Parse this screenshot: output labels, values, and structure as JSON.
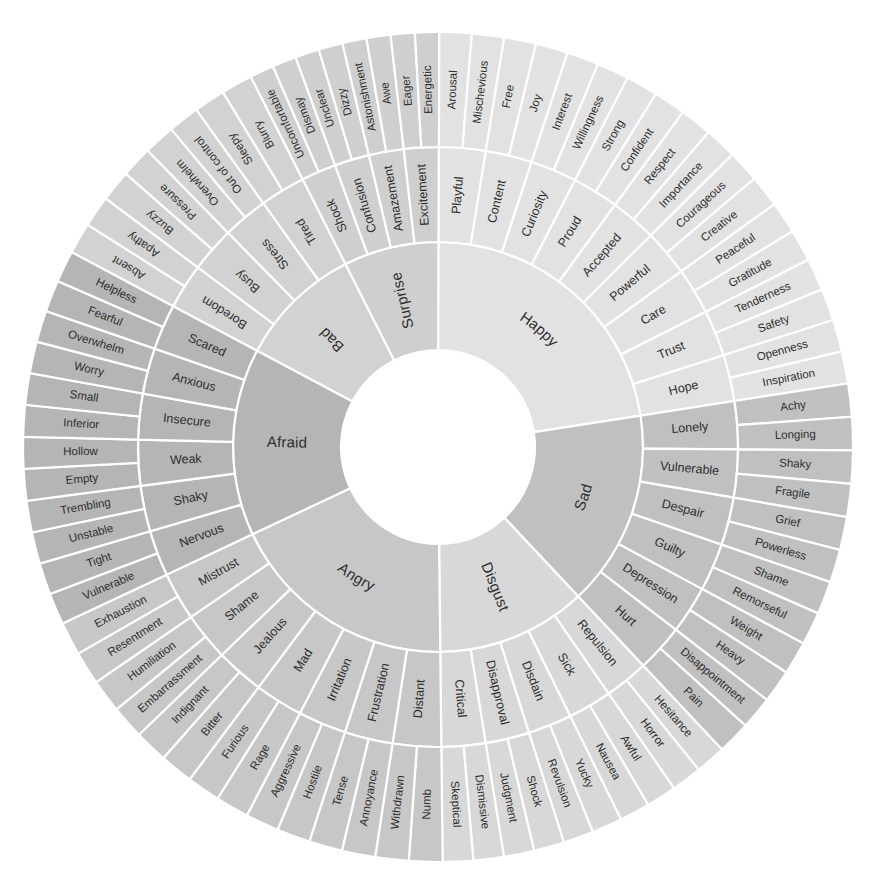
{
  "geometry": {
    "cx": 438,
    "cy": 447,
    "r_hole": 97,
    "r_core": 205,
    "r_mid": 300,
    "r_outer": 415,
    "start_angle_deg": -90
  },
  "palette": {
    "background": "#ffffff",
    "divider": "#ffffff",
    "text": "#2e2e2e",
    "fear": "#b5b5b5",
    "anger": "#c7c7c7",
    "disgust": "#d8d8d8",
    "sad": "#c0c0c0",
    "happy": "#e2e2e2",
    "surprise": "#cfcfcf",
    "bad": "#d2d2d2"
  },
  "chart_data": {
    "type": "pie",
    "rings": [
      "core",
      "secondary",
      "tertiary"
    ],
    "core_count": 7,
    "sectors": [
      {
        "core": "Bad",
        "color": "#d2d2d2",
        "span_deg": 43,
        "secondary": [
          {
            "label": "Boredom",
            "tertiary": [
              "Absent",
              "Apathy"
            ]
          },
          {
            "label": "Busy",
            "tertiary": [
              "Buzzy",
              "Pressure"
            ]
          },
          {
            "label": "Stress",
            "tertiary": [
              "Overwhelm",
              "Out of control"
            ]
          },
          {
            "label": "Tired",
            "tertiary": [
              "Sleepy",
              "Blurry"
            ]
          }
        ]
      },
      {
        "core": "Surprise",
        "color": "#cfcfcf",
        "span_deg": 33,
        "secondary": [
          {
            "label": "Shock",
            "tertiary": [
              "Uncomfortable",
              "Dismay"
            ]
          },
          {
            "label": "Confusion",
            "tertiary": [
              "Unclear",
              "Dizzy"
            ]
          },
          {
            "label": "Amazement",
            "tertiary": [
              "Astonishment",
              "Awe"
            ]
          },
          {
            "label": "Excitement",
            "tertiary": [
              "Eager",
              "Energetic"
            ]
          }
        ]
      },
      {
        "core": "Happy",
        "color": "#e2e2e2",
        "span_deg": 99,
        "secondary": [
          {
            "label": "Playful",
            "tertiary": [
              "Arousal",
              "Mischevious"
            ]
          },
          {
            "label": "Content",
            "tertiary": [
              "Free",
              "Joy"
            ]
          },
          {
            "label": "Curiosity",
            "tertiary": [
              "Interest",
              "Willingness"
            ]
          },
          {
            "label": "Proud",
            "tertiary": [
              "Strong",
              "Confident"
            ]
          },
          {
            "label": "Accepted",
            "tertiary": [
              "Respect",
              "Importance"
            ]
          },
          {
            "label": "Powerful",
            "tertiary": [
              "Courageous",
              "Creative"
            ]
          },
          {
            "label": "Care",
            "tertiary": [
              "Peaceful",
              "Gratitude"
            ]
          },
          {
            "label": "Trust",
            "tertiary": [
              "Tenderness",
              "Safety"
            ]
          },
          {
            "label": "Hope",
            "tertiary": [
              "Openness",
              "Inspiration"
            ]
          }
        ]
      },
      {
        "core": "Sad",
        "color": "#c0c0c0",
        "span_deg": 68,
        "secondary": [
          {
            "label": "Lonely",
            "tertiary": [
              "Achy",
              "Longing"
            ]
          },
          {
            "label": "Vulnerable",
            "tertiary": [
              "Shaky",
              "Fragile"
            ]
          },
          {
            "label": "Despair",
            "tertiary": [
              "Grief",
              "Powerless"
            ]
          },
          {
            "label": "Guilty",
            "tertiary": [
              "Shame",
              "Remorseful"
            ]
          },
          {
            "label": "Depression",
            "tertiary": [
              "Weight",
              "Heavy"
            ]
          },
          {
            "label": "Hurt",
            "tertiary": [
              "Disappointment",
              "Pain"
            ]
          }
        ]
      },
      {
        "core": "Disgust",
        "color": "#d8d8d8",
        "span_deg": 52,
        "secondary": [
          {
            "label": "Repulsion",
            "tertiary": [
              "Hesitance",
              "Horror"
            ]
          },
          {
            "label": "Sick",
            "tertiary": [
              "Awful",
              "Nausea"
            ]
          },
          {
            "label": "Disdain",
            "tertiary": [
              "Yucky",
              "Revulsion"
            ]
          },
          {
            "label": "Disapproval",
            "tertiary": [
              "Shock",
              "Judgment"
            ]
          },
          {
            "label": "Critical",
            "tertiary": [
              "Dismissive",
              "Skeptical"
            ]
          }
        ]
      },
      {
        "core": "Angry",
        "color": "#c7c7c7",
        "span_deg": 80,
        "secondary": [
          {
            "label": "Distant",
            "tertiary": [
              "Numb",
              "Withdrawn"
            ]
          },
          {
            "label": "Frustration",
            "tertiary": [
              "Annoyance",
              "Tense"
            ]
          },
          {
            "label": "Irritation",
            "tertiary": [
              "Hostile",
              "Aggressive"
            ]
          },
          {
            "label": "Mad",
            "tertiary": [
              "Rage",
              "Furious"
            ]
          },
          {
            "label": "Jealous",
            "tertiary": [
              "Bitter",
              "Indignant"
            ]
          },
          {
            "label": "Shame",
            "tertiary": [
              "Embarrassment",
              "Humiliation"
            ]
          },
          {
            "label": "Mistrust",
            "tertiary": [
              "Resentment",
              "Exhaustion"
            ]
          }
        ]
      },
      {
        "core": "Afraid",
        "color": "#b5b5b5",
        "span_deg": 65,
        "secondary": [
          {
            "label": "Nervous",
            "tertiary": [
              "Vulnerable",
              "Tight"
            ]
          },
          {
            "label": "Shaky",
            "tertiary": [
              "Unstable",
              "Trembling"
            ]
          },
          {
            "label": "Weak",
            "tertiary": [
              "Empty",
              "Hollow"
            ]
          },
          {
            "label": "Insecure",
            "tertiary": [
              "Inferior",
              "Small"
            ]
          },
          {
            "label": "Anxious",
            "tertiary": [
              "Worry",
              "Overwhelm"
            ]
          },
          {
            "label": "Scared",
            "tertiary": [
              "Fearful",
              "Helpless"
            ]
          }
        ]
      }
    ]
  }
}
